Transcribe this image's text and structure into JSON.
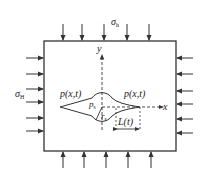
{
  "diagram": {
    "labels": {
      "sigma_h": "σ",
      "sigma_h_sub": "h",
      "sigma_H": "σ",
      "sigma_H_sub": "H",
      "y_axis": "y",
      "x_axis": "x",
      "pressure_left": "p(x,t)",
      "pressure_right": "p(x,t)",
      "p_s": "p",
      "p_s_sub": "s",
      "r_s": "r",
      "r_s_sub": "s",
      "crack_length": "L(t)"
    },
    "colors": {
      "line": "#333333",
      "background": "#ffffff"
    }
  }
}
